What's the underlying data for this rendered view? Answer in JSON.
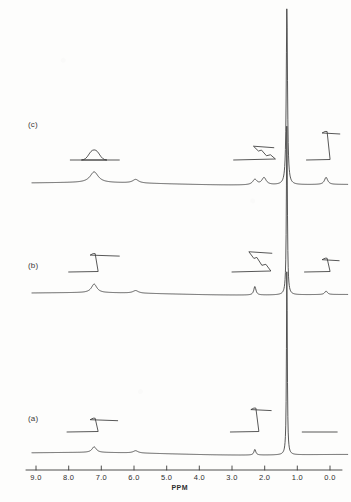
{
  "figure": {
    "kind": "stacked-1h-nmr-spectra",
    "background_color": "#fdfdfc",
    "line_color": "#3a3a3a"
  },
  "axis": {
    "title": "PPM",
    "unit": "ppm",
    "direction": "high-to-low",
    "min": 0.0,
    "max": 9.0,
    "tick_labels": [
      "9.0",
      "8.0",
      "7.0",
      "6.0",
      "5.0",
      "4.0",
      "3.0",
      "2.0",
      "1.0",
      "0.0"
    ],
    "tick_values": [
      9.0,
      8.0,
      7.0,
      6.0,
      5.0,
      4.0,
      3.0,
      2.0,
      1.0,
      0.0
    ]
  },
  "traces": [
    {
      "label": "(c)",
      "id": "trace-c",
      "peaks": [
        {
          "ppm": 7.22,
          "height": 0.06,
          "width": 0.3,
          "shape": "broad"
        },
        {
          "ppm": 5.95,
          "height": 0.02,
          "width": 0.22,
          "shape": "broad"
        },
        {
          "ppm": 2.3,
          "height": 0.03,
          "width": 0.16,
          "shape": "broad"
        },
        {
          "ppm": 2.02,
          "height": 0.04,
          "width": 0.16,
          "shape": "broad"
        },
        {
          "ppm": 1.32,
          "height": 1.0,
          "width": 0.045,
          "shape": "sharp"
        },
        {
          "ppm": 0.12,
          "height": 0.04,
          "width": 0.12,
          "shape": "sharp"
        }
      ],
      "integrals": [
        {
          "from_ppm": 7.95,
          "to_ppm": 6.45,
          "center_ppm": 7.22,
          "rise": 0.22,
          "shape": "rounded"
        },
        {
          "from_ppm": 2.95,
          "to_ppm": 1.72,
          "center_ppm": 2.16,
          "rise": 0.3,
          "shape": "stepped"
        },
        {
          "from_ppm": 0.72,
          "to_ppm": -0.3,
          "center_ppm": 0.12,
          "rise": 0.62,
          "shape": "sharp"
        }
      ]
    },
    {
      "label": "(b)",
      "id": "trace-b",
      "peaks": [
        {
          "ppm": 7.22,
          "height": 0.05,
          "width": 0.2,
          "shape": "broad"
        },
        {
          "ppm": 5.95,
          "height": 0.015,
          "width": 0.2,
          "shape": "broad"
        },
        {
          "ppm": 2.3,
          "height": 0.05,
          "width": 0.08,
          "shape": "sharp"
        },
        {
          "ppm": 1.32,
          "height": 1.0,
          "width": 0.035,
          "shape": "sharp"
        },
        {
          "ppm": 0.12,
          "height": 0.02,
          "width": 0.1,
          "shape": "sharp"
        }
      ],
      "integrals": [
        {
          "from_ppm": 8.0,
          "to_ppm": 6.45,
          "center_ppm": 7.22,
          "rise": 0.4,
          "shape": "sharp"
        },
        {
          "from_ppm": 3.0,
          "to_ppm": 1.78,
          "center_ppm": 2.3,
          "rise": 0.44,
          "shape": "stepped"
        },
        {
          "from_ppm": 0.78,
          "to_ppm": -0.28,
          "center_ppm": 0.12,
          "rise": 0.3,
          "shape": "sharp"
        }
      ]
    },
    {
      "label": "(a)",
      "id": "trace-a",
      "peaks": [
        {
          "ppm": 7.22,
          "height": 0.03,
          "width": 0.16,
          "shape": "sharp"
        },
        {
          "ppm": 5.95,
          "height": 0.012,
          "width": 0.18,
          "shape": "broad"
        },
        {
          "ppm": 2.3,
          "height": 0.03,
          "width": 0.07,
          "shape": "sharp"
        },
        {
          "ppm": 1.32,
          "height": 1.0,
          "width": 0.03,
          "shape": "sharp"
        }
      ],
      "integrals": [
        {
          "from_ppm": 8.05,
          "to_ppm": 6.5,
          "center_ppm": 7.22,
          "rise": 0.3,
          "shape": "sharp"
        },
        {
          "from_ppm": 3.05,
          "to_ppm": 1.8,
          "center_ppm": 2.3,
          "rise": 0.52,
          "shape": "sharp"
        },
        {
          "from_ppm": 0.85,
          "to_ppm": -0.22,
          "center_ppm": 0.12,
          "rise": 0.0,
          "shape": "flat"
        }
      ]
    }
  ]
}
